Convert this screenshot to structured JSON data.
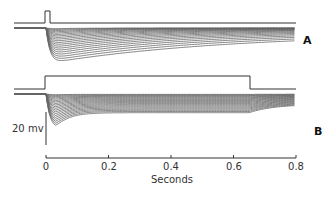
{
  "chart_data": {
    "type": "line",
    "title": "",
    "xlabel": "Seconds",
    "ylabel": "",
    "xlim": [
      0,
      0.8
    ],
    "x_ticks": [
      0,
      0.2,
      0.4,
      0.6,
      0.8
    ],
    "x_tick_labels": [
      "0",
      "0.2",
      "0.4",
      "0.6",
      "0.8"
    ],
    "scale_bar": {
      "label": "20 mv",
      "value_mv": 20
    },
    "grid": false,
    "legend": null,
    "panels": [
      {
        "label": "A",
        "stimulus": {
          "type": "brief pulse",
          "onset_s": 0.0,
          "duration_s": 0.012
        },
        "description": "Family of ~20 hyperpolarizing voltage responses; fast negative peak near 0.04 s then slow decay back toward baseline over 0.8 s",
        "series_count": 20,
        "peak_time_s": 0.045,
        "peak_amplitude_range_mv": [
          -2,
          -20
        ]
      },
      {
        "label": "B",
        "stimulus": {
          "type": "step",
          "onset_s": 0.0,
          "offset_s": 0.65
        },
        "description": "Family of ~20 hyperpolarizing voltage responses to prolonged step; rapid negative peak near 0.04 s, partial relaxation to a sustained plateau, then recovery after step offset at 0.65 s",
        "series_count": 20,
        "peak_time_s": 0.04,
        "peak_amplitude_range_mv": [
          -2,
          -20
        ],
        "plateau_amplitude_range_mv": [
          -1,
          -15
        ]
      }
    ]
  },
  "labels": {
    "panel_a": "A",
    "panel_b": "B",
    "scale": "20 mv",
    "xlabel": "Seconds",
    "ticks": [
      "0",
      "0.2",
      "0.4",
      "0.6",
      "0.8"
    ]
  },
  "colors": {
    "trace": "#555555",
    "stimulus": "#333333",
    "axis": "#333333"
  }
}
